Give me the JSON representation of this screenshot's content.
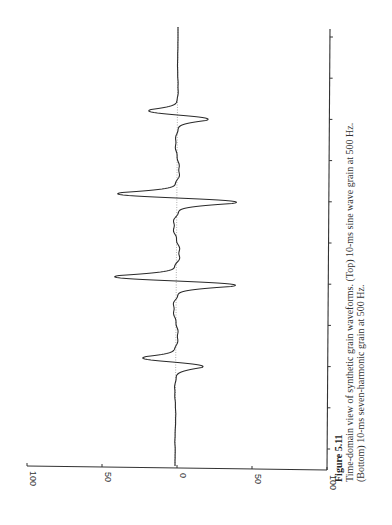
{
  "caption": {
    "label": "Figure 5.11",
    "line1": "Time-domain view of synthetic grain waveforms. (Top) 10-ms sine wave grain at 500 Hz.",
    "line2": "(Bottom) 10-ms seven-harmonic grain at 500 Hz."
  },
  "chart_data": {
    "type": "line",
    "orientation": "rotated 90° counter-clockwise on page",
    "title": "",
    "xlabel": "",
    "ylabel": "",
    "series": [
      {
        "name": "10-ms seven-harmonic grain at 500 Hz",
        "description": "Four main pulses (one per period) with small ringing oscillations between them; pulse amplitudes approx +/-36, +/-71, +/-73, +/-40 in envelope-shaped sequence",
        "peaks": [
          {
            "period": 1,
            "neg": -36,
            "pos": 38
          },
          {
            "period": 2,
            "neg": -71,
            "pos": 71
          },
          {
            "period": 3,
            "neg": -73,
            "pos": 70
          },
          {
            "period": 4,
            "neg": -40,
            "pos": 34
          }
        ]
      }
    ],
    "y_tick_labels": [
      "100",
      "50",
      "0",
      "50",
      "100"
    ],
    "ylim": [
      -100,
      100
    ],
    "x_ticks_count": 11,
    "grid": false,
    "legend": "none"
  },
  "axis": {
    "amp_labels": [
      "100",
      "50",
      "0",
      "50",
      "100"
    ]
  }
}
